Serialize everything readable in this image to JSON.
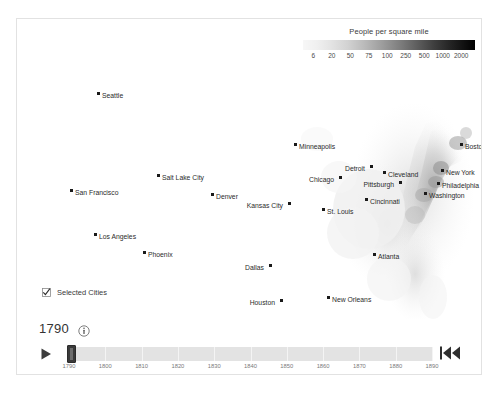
{
  "legend": {
    "title": "People per square mile",
    "ticks": [
      "6",
      "20",
      "50",
      "75",
      "100",
      "250",
      "500",
      "1000",
      "2000"
    ],
    "gradient_from": "#f7f7f7",
    "gradient_to": "#000000"
  },
  "map": {
    "cities": [
      {
        "name": "Seattle",
        "x": 80,
        "y": 73,
        "align": "right"
      },
      {
        "name": "Salt Lake City",
        "x": 140,
        "y": 155,
        "align": "right"
      },
      {
        "name": "San Francisco",
        "x": 53,
        "y": 170,
        "align": "right"
      },
      {
        "name": "Denver",
        "x": 194,
        "y": 174,
        "align": "right"
      },
      {
        "name": "Los Angeles",
        "x": 77,
        "y": 214,
        "align": "right"
      },
      {
        "name": "Phoenix",
        "x": 126,
        "y": 232,
        "align": "right"
      },
      {
        "name": "Minneapolis",
        "x": 277,
        "y": 124,
        "align": "right"
      },
      {
        "name": "Detroit",
        "x": 353,
        "y": 146,
        "align": "left"
      },
      {
        "name": "Chicago",
        "x": 322,
        "y": 157,
        "align": "left"
      },
      {
        "name": "Cleveland",
        "x": 366,
        "y": 152,
        "align": "right"
      },
      {
        "name": "Boston",
        "x": 443,
        "y": 124,
        "align": "right"
      },
      {
        "name": "New York",
        "x": 424,
        "y": 150,
        "align": "right"
      },
      {
        "name": "Pittsburgh",
        "x": 382,
        "y": 162,
        "align": "left"
      },
      {
        "name": "Philadelphia",
        "x": 420,
        "y": 163,
        "align": "right"
      },
      {
        "name": "Washington",
        "x": 407,
        "y": 173,
        "align": "right"
      },
      {
        "name": "Kansas City",
        "x": 271,
        "y": 183,
        "align": "left"
      },
      {
        "name": "Cincinnati",
        "x": 348,
        "y": 179,
        "align": "right"
      },
      {
        "name": "St. Louis",
        "x": 305,
        "y": 189,
        "align": "right"
      },
      {
        "name": "Atlanta",
        "x": 356,
        "y": 234,
        "align": "right"
      },
      {
        "name": "Dallas",
        "x": 252,
        "y": 245,
        "align": "left"
      },
      {
        "name": "New Orleans",
        "x": 310,
        "y": 277,
        "align": "right"
      },
      {
        "name": "Houston",
        "x": 263,
        "y": 280,
        "align": "left"
      },
      {
        "name": "Miami",
        "x": 403,
        "y": 310,
        "align": "right"
      }
    ]
  },
  "controls": {
    "selected_cities_label": "Selected Cities",
    "selected_cities_checked": true,
    "year": "1790",
    "info_icon": "info-icon",
    "play_icon": "play-icon",
    "rewind_icon": "skip-to-start-icon",
    "timeline_ticks": [
      "1790",
      "1800",
      "1810",
      "1820",
      "1830",
      "1840",
      "1850",
      "1860",
      "1870",
      "1880",
      "1890"
    ],
    "timeline_min": "1790",
    "timeline_max": "1890",
    "timeline_value": "1790"
  }
}
